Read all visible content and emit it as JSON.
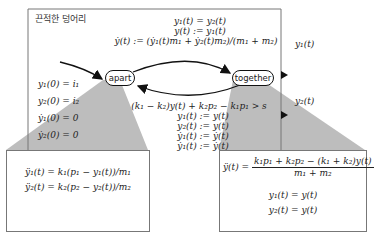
{
  "title": "끈적한 덩어리",
  "states": {
    "apart": "apart",
    "together": "together"
  },
  "transition_top": {
    "guard": "y₁(t) = y₂(t)",
    "reset1": "y(t) := y₁(t)",
    "reset2": "ẏ(t) := (ẏ₁(t)m₁ + ẏ₂(t)m₂)/(m₁ + m₂)"
  },
  "transition_bottom": {
    "guard": "(k₁ − k₂)y(t) + k₂p₂ − k₁p₁ > s",
    "reset1": "y₁(t) := y(t)",
    "reset2": "y₂(t) := y(t)",
    "reset3": "ẏ₁(t) := ẏ(t)",
    "reset4": "ẏ₁(t) := ẏ(t)"
  },
  "initial": [
    "y₁(0) = i₁",
    "y₂(0) = i₂",
    "ẏ₁(0) = 0",
    "ẏ₂(0) = 0"
  ],
  "outputs": {
    "y1": "y₁(t)",
    "y2": "y₂(t)"
  },
  "apart_dynamics": [
    "ÿ₁(t) = k₁(p₁ − y₁(t))/m₁",
    "ÿ₂(t) = k₂(p₂ − y₂(t))/m₂"
  ],
  "together_dynamics": {
    "lhs": "ÿ(t) =",
    "numerator": "k₁p₁ + k₂p₂ − (k₁ + k₂)y(t)",
    "denominator": "m₁ + m₂",
    "eq1": "y₁(t) = y(t)",
    "eq2": "y₂(t) = y(t)"
  }
}
